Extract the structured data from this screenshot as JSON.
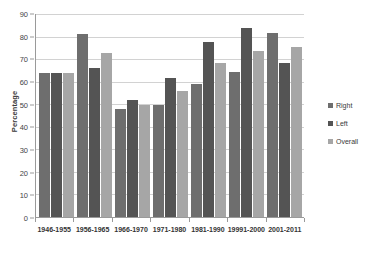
{
  "chart_data": {
    "type": "bar",
    "title": "",
    "xlabel": "",
    "ylabel": "Percentage",
    "ylim": [
      0,
      90
    ],
    "ytick_step": 10,
    "yticks": [
      0,
      10,
      20,
      30,
      40,
      50,
      60,
      70,
      80,
      90
    ],
    "grid": true,
    "legend_position": "right",
    "categories": [
      "1946-1955",
      "1956-1965",
      "1966-1970",
      "1971-1980",
      "1981-1990",
      "19991-2000",
      "2001-2011"
    ],
    "series": [
      {
        "name": "Right",
        "color": "#6e6e6e",
        "values": [
          63.8,
          81.0,
          48.0,
          49.8,
          58.9,
          64.5,
          81.4
        ]
      },
      {
        "name": "Left",
        "color": "#545454",
        "values": [
          63.8,
          66.0,
          51.9,
          61.8,
          77.6,
          83.8,
          68.5
        ]
      },
      {
        "name": "Overall",
        "color": "#a6a6a6",
        "values": [
          63.8,
          72.8,
          49.8,
          55.8,
          68.4,
          73.4,
          75.5
        ]
      }
    ]
  },
  "axes": {
    "y_title": "Percentage"
  }
}
